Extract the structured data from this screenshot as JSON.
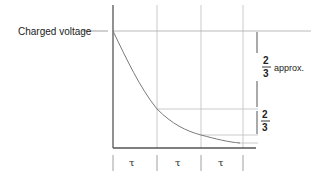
{
  "diagram": {
    "labels": {
      "charged_voltage": "Charged voltage",
      "upper_fraction_num": "2",
      "upper_fraction_den": "3",
      "upper_fraction_suffix": "approx.",
      "lower_fraction_num": "2",
      "lower_fraction_den": "3"
    },
    "time_constants": [
      "τ",
      "τ",
      "τ"
    ],
    "colors": {
      "axis": "#555555",
      "grid": "#b5b5b5",
      "curve": "#777777",
      "text": "#222222"
    }
  }
}
